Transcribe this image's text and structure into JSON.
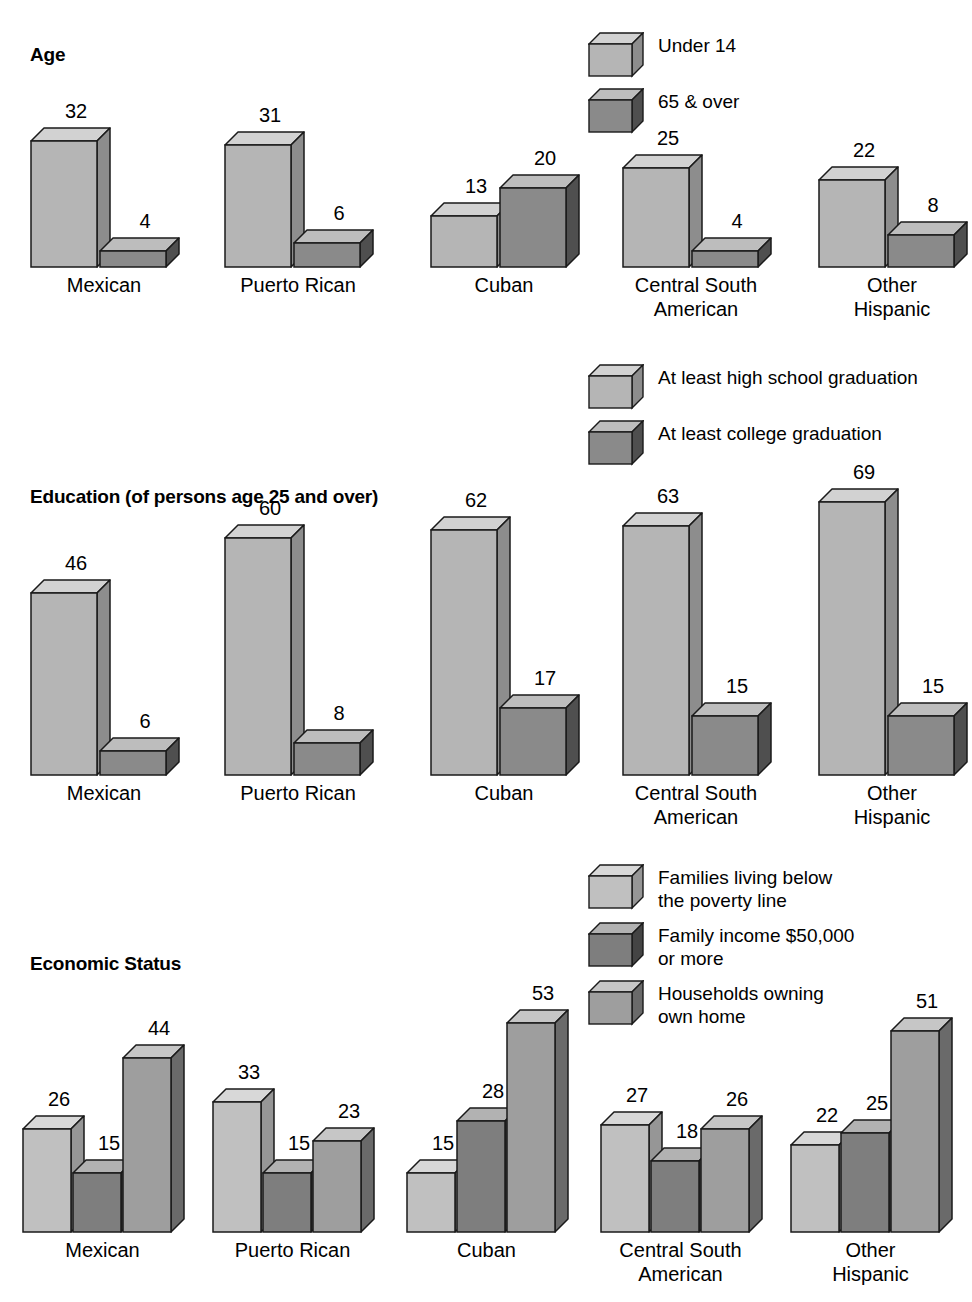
{
  "chart_data": [
    {
      "type": "bar",
      "title": "Age",
      "xlabel": "",
      "ylabel": "",
      "grid": false,
      "legend_position": "top-right",
      "categories": [
        "Mexican",
        "Puerto Rican",
        "Cuban",
        "Central South\nAmerican",
        "Other\nHispanic"
      ],
      "series": [
        {
          "name": "Under 14",
          "color": "#b5b5b5",
          "values": [
            32,
            31,
            13,
            25,
            22
          ]
        },
        {
          "name": "65 & over",
          "color": "#8a8a8a",
          "values": [
            4,
            6,
            20,
            4,
            8
          ]
        }
      ],
      "ylim": [
        0,
        70
      ]
    },
    {
      "type": "bar",
      "title": "Education (of persons age 25 and over)",
      "xlabel": "",
      "ylabel": "",
      "grid": false,
      "legend_position": "top-right",
      "categories": [
        "Mexican",
        "Puerto Rican",
        "Cuban",
        "Central South\nAmerican",
        "Other\nHispanic"
      ],
      "series": [
        {
          "name": "At least high school graduation",
          "color": "#b5b5b5",
          "values": [
            46,
            60,
            62,
            63,
            69
          ]
        },
        {
          "name": "At least college graduation",
          "color": "#8a8a8a",
          "values": [
            6,
            8,
            17,
            15,
            15
          ]
        }
      ],
      "ylim": [
        0,
        70
      ]
    },
    {
      "type": "bar",
      "title": "Economic Status",
      "xlabel": "",
      "ylabel": "",
      "grid": false,
      "legend_position": "top-right",
      "categories": [
        "Mexican",
        "Puerto Rican",
        "Cuban",
        "Central South\nAmerican",
        "Other\nHispanic"
      ],
      "series": [
        {
          "name": "Families living below\nthe poverty line",
          "color": "#c0c0c0",
          "values": [
            26,
            33,
            15,
            27,
            22
          ]
        },
        {
          "name": "Family income $50,000\nor more",
          "color": "#7e7e7e",
          "values": [
            15,
            15,
            28,
            18,
            25
          ]
        },
        {
          "name": "Households owning\nown home",
          "color": "#9e9e9e",
          "values": [
            44,
            23,
            53,
            26,
            51
          ]
        }
      ],
      "ylim": [
        0,
        70
      ]
    }
  ],
  "sections": {
    "age": {
      "title": "Age",
      "legend": [
        {
          "label": "Under 14"
        },
        {
          "label": "65 & over"
        }
      ],
      "groups": [
        {
          "label": "Mexican",
          "values": [
            "32",
            "4"
          ]
        },
        {
          "label": "Puerto Rican",
          "values": [
            "31",
            "6"
          ]
        },
        {
          "label": "Cuban",
          "values": [
            "13",
            "20"
          ]
        },
        {
          "label": "Central South\nAmerican",
          "values": [
            "25",
            "4"
          ]
        },
        {
          "label": "Other\nHispanic",
          "values": [
            "22",
            "8"
          ]
        }
      ]
    },
    "education": {
      "title": "Education (of persons age 25 and over)",
      "legend": [
        {
          "label": "At least high school graduation"
        },
        {
          "label": "At least college graduation"
        }
      ],
      "groups": [
        {
          "label": "Mexican",
          "values": [
            "46",
            "6"
          ]
        },
        {
          "label": "Puerto Rican",
          "values": [
            "60",
            "8"
          ]
        },
        {
          "label": "Cuban",
          "values": [
            "62",
            "17"
          ]
        },
        {
          "label": "Central South\nAmerican",
          "values": [
            "63",
            "15"
          ]
        },
        {
          "label": "Other\nHispanic",
          "values": [
            "69",
            "15"
          ]
        }
      ]
    },
    "economic": {
      "title": "Economic Status",
      "legend": [
        {
          "label": "Families living below\nthe poverty line"
        },
        {
          "label": "Family income $50,000\nor more"
        },
        {
          "label": "Households owning\nown home"
        }
      ],
      "groups": [
        {
          "label": "Mexican",
          "values": [
            "26",
            "15",
            "44"
          ]
        },
        {
          "label": "Puerto Rican",
          "values": [
            "33",
            "15",
            "23"
          ]
        },
        {
          "label": "Cuban",
          "values": [
            "15",
            "28",
            "53"
          ]
        },
        {
          "label": "Central South\nAmerican",
          "values": [
            "27",
            "18",
            "26"
          ]
        },
        {
          "label": "Other\nHispanic",
          "values": [
            "22",
            "25",
            "51"
          ]
        }
      ]
    }
  },
  "palette": {
    "light": "#b5b5b5",
    "light_top": "#d2d2d2",
    "light_side": "#8d8d8d",
    "dark": "#8a8a8a",
    "dark_top": "#bdbdbd",
    "dark_side": "#4f4f4f",
    "mid": "#9e9e9e",
    "mid_top": "#c6c6c6",
    "mid_side": "#6a6a6a",
    "outline": "#1a1a1a",
    "background": "#ffffff"
  }
}
